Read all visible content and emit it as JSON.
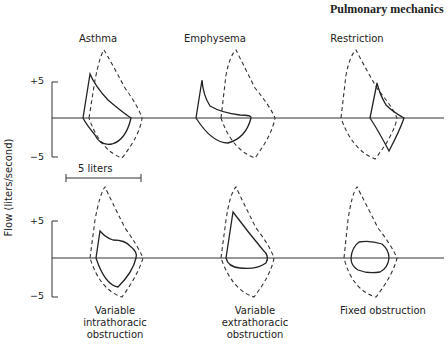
{
  "title": "Pulmonary mechanics",
  "y_axis": {
    "label": "Flow (liters/second)",
    "top_row_ticks": [
      "+5",
      "−5"
    ],
    "bottom_row_ticks": [
      "+5",
      "−5"
    ]
  },
  "scale_bar": {
    "label": "5 liters"
  },
  "panels": {
    "top": [
      {
        "label": "Asthma"
      },
      {
        "label": "Emphysema"
      },
      {
        "label": "Restriction"
      }
    ],
    "bottom": [
      {
        "label_line1": "Variable",
        "label_line2": "intrathoracic",
        "label_line3": "obstruction"
      },
      {
        "label_line1": "Variable",
        "label_line2": "extrathoracic",
        "label_line3": "obstruction"
      },
      {
        "label_line1": "Fixed obstruction"
      }
    ]
  },
  "legend_semantics": {
    "solid": "abnormal flow-volume loop",
    "dashed": "normal flow-volume loop"
  }
}
